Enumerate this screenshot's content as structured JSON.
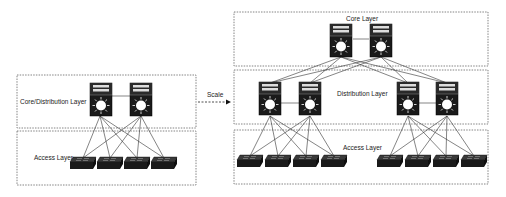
{
  "diagram": {
    "type": "network-topology",
    "left": {
      "layers": [
        {
          "label": "Core/Distribution Layer"
        },
        {
          "label": "Access Layer"
        }
      ],
      "multilayer_switches": 2,
      "access_switches": 4
    },
    "arrow": {
      "label": "Scale"
    },
    "right": {
      "layers": [
        {
          "label": "Core Layer"
        },
        {
          "label": "Distribution Layer"
        },
        {
          "label": "Access Layer"
        }
      ],
      "core_switches": 2,
      "distribution_switches": 4,
      "access_switches": 8
    }
  }
}
